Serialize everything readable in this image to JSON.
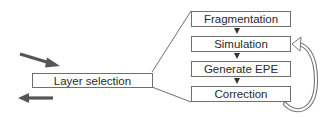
{
  "diagram": {
    "input_box": {
      "label": "Layer selection"
    },
    "steps": [
      {
        "label": "Fragmentation"
      },
      {
        "label": "Simulation"
      },
      {
        "label": "Generate EPE"
      },
      {
        "label": "Correction"
      }
    ],
    "loop": {
      "from": "Correction",
      "to": "Simulation"
    },
    "arrows": [
      {
        "name": "input-arrow",
        "direction": "down-right"
      },
      {
        "name": "output-arrow",
        "direction": "left"
      }
    ],
    "colors": {
      "box_border": "#6f6f6f",
      "arrow_dark": "#555555",
      "text": "#2a2a2a"
    }
  }
}
